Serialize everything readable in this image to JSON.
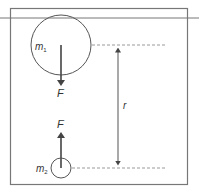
{
  "diagram": {
    "labels": {
      "mass1": "m",
      "mass1_sub": "1",
      "mass2": "m",
      "mass2_sub": "2",
      "force_top": "F",
      "force_bottom": "F",
      "distance": "r"
    },
    "colors": {
      "stroke": "#555555",
      "frame": "#777777",
      "dashed": "#999999",
      "text": "#333333"
    }
  }
}
